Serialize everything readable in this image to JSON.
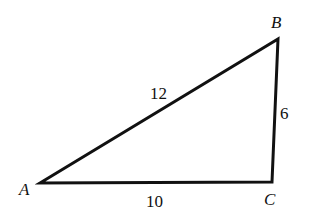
{
  "diagram": {
    "type": "triangle",
    "colors": {
      "stroke": "#111111",
      "background": "#ffffff",
      "text": "#111111"
    },
    "vertices": [
      {
        "name": "A",
        "x": 40,
        "y": 183,
        "label": "A",
        "label_x": 19,
        "label_y": 195
      },
      {
        "name": "B",
        "x": 278,
        "y": 39,
        "label": "B",
        "label_x": 271,
        "label_y": 28
      },
      {
        "name": "C",
        "x": 272,
        "y": 182,
        "label": "C",
        "label_x": 264,
        "label_y": 205
      }
    ],
    "sides": [
      {
        "from": "A",
        "to": "B",
        "length_label": "12",
        "label_x": 150,
        "label_y": 99
      },
      {
        "from": "B",
        "to": "C",
        "length_label": "6",
        "label_x": 280,
        "label_y": 119
      },
      {
        "from": "A",
        "to": "C",
        "length_label": "10",
        "label_x": 146,
        "label_y": 207
      }
    ]
  }
}
